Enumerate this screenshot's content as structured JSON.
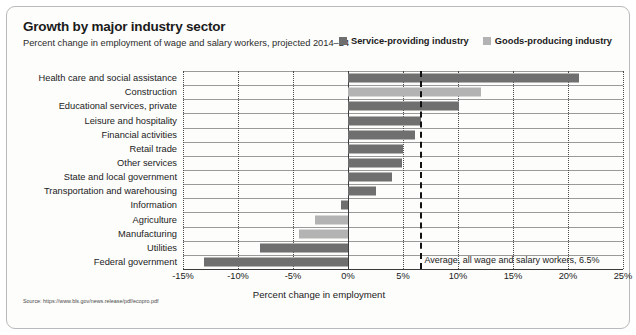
{
  "chart_data": {
    "type": "bar",
    "orientation": "horizontal",
    "title": "Growth by major industry sector",
    "subtitle": "Percent change in employment of wage and salary workers, projected 2014–24",
    "xlabel": "Percent change in employment",
    "ylabel": "",
    "xlim": [
      -15,
      25
    ],
    "xticks": [
      -15,
      -10,
      -5,
      0,
      5,
      10,
      15,
      20,
      25
    ],
    "xtick_labels": [
      "-15%",
      "-10%",
      "-5%",
      "0%",
      "5%",
      "10%",
      "15%",
      "20%",
      "25%"
    ],
    "grid": true,
    "legend_position": "top-right",
    "legend": [
      {
        "name": "Service-providing industry",
        "color": "#6f6f6f"
      },
      {
        "name": "Goods-producing industry",
        "color": "#b3b3b3"
      }
    ],
    "annotations": [
      {
        "label": "Average, all wage and salary workers, 6.5%",
        "value": 6.5,
        "style": "dashed-vertical-line"
      }
    ],
    "categories": [
      "Health care and social assistance",
      "Construction",
      "Educational services, private",
      "Leisure and hospitality",
      "Financial activities",
      "Retail trade",
      "Other services",
      "State and local government",
      "Transportation and warehousing",
      "Information",
      "Agriculture",
      "Manufacturing",
      "Utilities",
      "Federal government"
    ],
    "values": [
      21.0,
      12.1,
      10.1,
      6.6,
      6.1,
      5.0,
      4.9,
      4.0,
      2.5,
      -0.6,
      -3.0,
      -4.5,
      -8.0,
      -13.1
    ],
    "group": [
      "Service-providing industry",
      "Goods-producing industry",
      "Service-providing industry",
      "Service-providing industry",
      "Service-providing industry",
      "Service-providing industry",
      "Service-providing industry",
      "Service-providing industry",
      "Service-providing industry",
      "Service-providing industry",
      "Goods-producing industry",
      "Goods-producing industry",
      "Service-providing industry",
      "Service-providing industry"
    ]
  },
  "source": {
    "text": "Source: https://www.bls.gov/news.release/pdf/ecopro.pdf"
  }
}
